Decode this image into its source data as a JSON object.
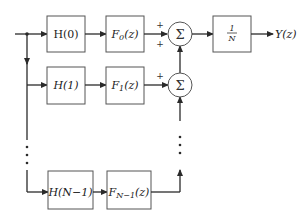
{
  "diagram": {
    "type": "block-diagram",
    "input_label": "",
    "rows": [
      {
        "h_label": "H(0)",
        "f_label": "F",
        "f_sub": "0",
        "f_arg": "(z)"
      },
      {
        "h_label": "H(1)",
        "f_label": "F",
        "f_sub": "1",
        "f_arg": "(z)"
      },
      {
        "h_label": "H(N−1)",
        "f_label": "F",
        "f_sub": "N−1",
        "f_arg": "(z)"
      }
    ],
    "summers": [
      {
        "symbol": "Σ",
        "signs": [
          "+",
          "+"
        ]
      },
      {
        "symbol": "Σ",
        "signs": [
          "+"
        ]
      }
    ],
    "scale_block": {
      "numerator": "1",
      "denominator": "N"
    },
    "output_label": "Y(z)",
    "ellipsis": "⋮"
  }
}
